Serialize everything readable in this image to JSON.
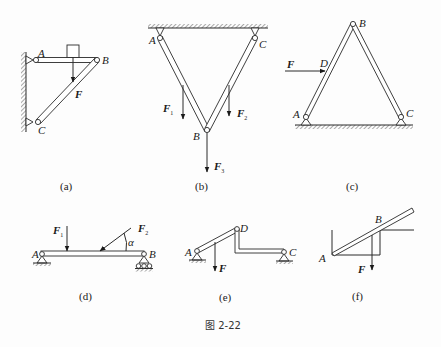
{
  "figure": {
    "caption": "图 2-22",
    "panels": [
      {
        "id": "a",
        "label": "(a)",
        "points": [
          "A",
          "B",
          "C"
        ],
        "forces": [
          {
            "name": "F",
            "main": "F",
            "sub": ""
          }
        ],
        "description": "Horizontal bar AB pinned to wall at A, inclined bar BC pinned to wall at C, block resting on AB, load F acting downward"
      },
      {
        "id": "b",
        "label": "(b)",
        "points": [
          "A",
          "B",
          "C"
        ],
        "forces": [
          {
            "name": "F1",
            "main": "F",
            "sub": "1"
          },
          {
            "name": "F2",
            "main": "F",
            "sub": "2"
          },
          {
            "name": "F3",
            "main": "F",
            "sub": "3"
          }
        ],
        "description": "V-shaped two-bar truss hanging from ceiling supports A and C, joined at B"
      },
      {
        "id": "c",
        "label": "(c)",
        "points": [
          "A",
          "B",
          "C",
          "D"
        ],
        "forces": [
          {
            "name": "F",
            "main": "F",
            "sub": ""
          }
        ],
        "description": "Three-hinged A-frame with pins at A and C on ground, hinge at B, horizontal force F at D"
      },
      {
        "id": "d",
        "label": "(d)",
        "points": [
          "A",
          "B"
        ],
        "angle": "α",
        "forces": [
          {
            "name": "F1",
            "main": "F",
            "sub": "1"
          },
          {
            "name": "F2",
            "main": "F",
            "sub": "2"
          }
        ],
        "description": "Simply supported beam: pin at A, roller at B, vertical F1 and inclined F2 at angle α"
      },
      {
        "id": "e",
        "label": "(e)",
        "points": [
          "A",
          "C",
          "D"
        ],
        "forces": [
          {
            "name": "F",
            "main": "F",
            "sub": ""
          }
        ],
        "description": "Inclined bar AD and bent bar DC joined by hinge D, pins at A and C, load F on AD"
      },
      {
        "id": "f",
        "label": "(f)",
        "points": [
          "A",
          "B"
        ],
        "forces": [
          {
            "name": "F",
            "main": "F",
            "sub": ""
          }
        ],
        "description": "Inclined bar resting at corner A and on edge B of a step, load F acting downward"
      }
    ]
  }
}
